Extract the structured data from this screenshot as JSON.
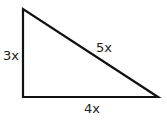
{
  "diagram": {
    "type": "right-triangle",
    "stroke_color": "#111111",
    "labels": {
      "left_side": "3x",
      "hypotenuse": "5x",
      "bottom_side": "4x"
    }
  }
}
